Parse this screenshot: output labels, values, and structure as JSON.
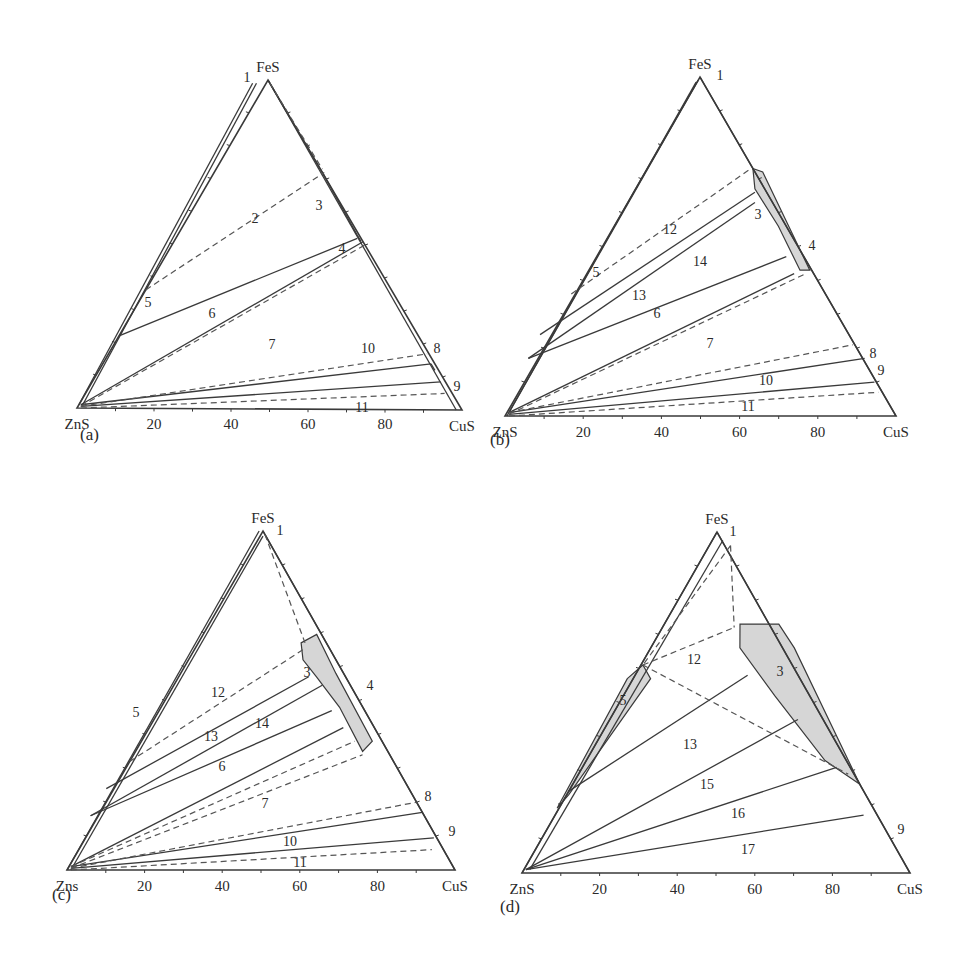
{
  "figure": {
    "line_color": "#3a3a3a",
    "dash_color": "#555555",
    "fill_color": "#d6d6d6"
  },
  "panels": [
    {
      "id": "a",
      "label": "(a)",
      "vertices": {
        "ZnS": [
          77,
          408
        ],
        "CuS": [
          462,
          410
        ],
        "FeS": [
          268,
          80
        ]
      },
      "vertex_labels": {
        "left": "ZnS",
        "right": "CuS",
        "top": "FeS"
      },
      "tick_labels": [
        "20",
        "40",
        "60",
        "80"
      ],
      "label_pos": [
        80,
        440
      ],
      "solid_lines": [
        [
          [
            0.005,
            0.01
          ],
          [
            0.46,
            0.99
          ]
        ],
        [
          [
            0.015,
            0.01
          ],
          [
            0.47,
            0.99
          ]
        ],
        [
          [
            0.5,
            1.0
          ],
          [
            0.985,
            0.0
          ]
        ],
        [
          [
            0.11,
            0.22
          ],
          [
            0.73,
            0.52
          ]
        ],
        [
          [
            0.01,
            0.01
          ],
          [
            0.745,
            0.51
          ]
        ],
        [
          [
            0.01,
            0.01
          ],
          [
            0.92,
            0.14
          ]
        ],
        [
          [
            0.01,
            0.005
          ],
          [
            0.945,
            0.085
          ]
        ],
        [
          [
            0.5,
            1.0
          ],
          [
            0.64,
            0.72
          ]
        ],
        [
          [
            0.64,
            0.72
          ],
          [
            0.73,
            0.53
          ]
        ],
        [
          [
            0.73,
            0.53
          ],
          [
            0.74,
            0.51
          ]
        ],
        [
          [
            0.92,
            0.14
          ],
          [
            0.93,
            0.12
          ]
        ]
      ],
      "dashed_lines": [
        [
          [
            0.18,
            0.36
          ],
          [
            0.645,
            0.72
          ]
        ],
        [
          [
            0.01,
            0.005
          ],
          [
            0.75,
            0.5
          ]
        ],
        [
          [
            0.01,
            0.005
          ],
          [
            0.91,
            0.17
          ]
        ],
        [
          [
            0.01,
            0.0
          ],
          [
            0.955,
            0.05
          ]
        ],
        [
          [
            0.505,
            0.99
          ],
          [
            0.64,
            0.73
          ]
        ]
      ],
      "filled_regions": [],
      "region_labels": [
        {
          "text": "1",
          "pos": [
            247,
            82
          ]
        },
        {
          "text": "2",
          "pos": [
            255,
            223
          ]
        },
        {
          "text": "3",
          "pos": [
            319,
            210
          ]
        },
        {
          "text": "4",
          "pos": [
            342,
            253
          ]
        },
        {
          "text": "5",
          "pos": [
            148,
            307
          ]
        },
        {
          "text": "6",
          "pos": [
            212,
            318
          ]
        },
        {
          "text": "7",
          "pos": [
            272,
            349
          ]
        },
        {
          "text": "10",
          "pos": [
            368,
            353
          ]
        },
        {
          "text": "8",
          "pos": [
            437,
            353
          ]
        },
        {
          "text": "9",
          "pos": [
            457,
            391
          ]
        },
        {
          "text": "11",
          "pos": [
            362,
            412
          ]
        }
      ]
    },
    {
      "id": "b",
      "label": "(b)",
      "vertices": {
        "ZnS": [
          505,
          416
        ],
        "CuS": [
          896,
          416
        ],
        "FeS": [
          700,
          77
        ]
      },
      "vertex_labels": {
        "left": "ZnS",
        "right": "CuS",
        "top": "FeS"
      },
      "tick_labels": [
        "20",
        "40",
        "60",
        "80"
      ],
      "label_pos": [
        490,
        445
      ],
      "solid_lines": [
        [
          [
            0.01,
            0.01
          ],
          [
            0.495,
            0.99
          ]
        ],
        [
          [
            0.005,
            0.0
          ],
          [
            0.49,
            0.985
          ]
        ],
        [
          [
            0.5,
            1.0
          ],
          [
            1.0,
            0.0
          ]
        ],
        [
          [
            0.09,
            0.24
          ],
          [
            0.64,
            0.66
          ]
        ],
        [
          [
            0.06,
            0.17
          ],
          [
            0.64,
            0.63
          ]
        ],
        [
          [
            0.06,
            0.17
          ],
          [
            0.72,
            0.47
          ]
        ],
        [
          [
            0.01,
            0.01
          ],
          [
            0.74,
            0.42
          ]
        ],
        [
          [
            0.01,
            0.01
          ],
          [
            0.92,
            0.17
          ]
        ],
        [
          [
            0.01,
            0.005
          ],
          [
            0.945,
            0.1
          ]
        ]
      ],
      "dashed_lines": [
        [
          [
            0.17,
            0.36
          ],
          [
            0.63,
            0.73
          ]
        ],
        [
          [
            0.01,
            0.005
          ],
          [
            0.77,
            0.42
          ]
        ],
        [
          [
            0.01,
            0.01
          ],
          [
            0.89,
            0.21
          ]
        ],
        [
          [
            0.01,
            0.0
          ],
          [
            0.955,
            0.07
          ]
        ]
      ],
      "filled_regions": [
        {
          "points": [
            [
              0.635,
              0.73
            ],
            [
              0.66,
              0.72
            ],
            [
              0.78,
              0.43
            ],
            [
              0.755,
              0.43
            ],
            [
              0.7,
              0.56
            ],
            [
              0.64,
              0.67
            ]
          ]
        }
      ],
      "region_labels": [
        {
          "text": "1",
          "pos": [
            720,
            80
          ]
        },
        {
          "text": "3",
          "pos": [
            758,
            219
          ]
        },
        {
          "text": "4",
          "pos": [
            812,
            250
          ]
        },
        {
          "text": "12",
          "pos": [
            670,
            234
          ]
        },
        {
          "text": "5",
          "pos": [
            596,
            277
          ]
        },
        {
          "text": "14",
          "pos": [
            700,
            266
          ]
        },
        {
          "text": "13",
          "pos": [
            639,
            300
          ]
        },
        {
          "text": "6",
          "pos": [
            657,
            318
          ]
        },
        {
          "text": "7",
          "pos": [
            710,
            348
          ]
        },
        {
          "text": "8",
          "pos": [
            873,
            358
          ]
        },
        {
          "text": "9",
          "pos": [
            881,
            375
          ]
        },
        {
          "text": "10",
          "pos": [
            766,
            385
          ]
        },
        {
          "text": "11",
          "pos": [
            748,
            411
          ]
        }
      ]
    },
    {
      "id": "c",
      "label": "(c)",
      "vertices": {
        "ZnS": [
          67,
          870
        ],
        "CuS": [
          455,
          870
        ],
        "FeS": [
          263,
          531
        ]
      },
      "vertex_labels": {
        "left": "Zns",
        "right": "CuS",
        "top": "FeS"
      },
      "tick_labels": [
        "20",
        "40",
        "60",
        "80"
      ],
      "label_pos": [
        52,
        900
      ],
      "solid_lines": [
        [
          [
            0.0,
            0.0
          ],
          [
            0.49,
            1.0
          ]
        ],
        [
          [
            0.01,
            0.0
          ],
          [
            0.5,
            0.985
          ]
        ],
        [
          [
            0.5,
            1.0
          ],
          [
            1.0,
            0.0
          ]
        ],
        [
          [
            0.1,
            0.24
          ],
          [
            0.62,
            0.57
          ]
        ],
        [
          [
            0.06,
            0.16
          ],
          [
            0.655,
            0.545
          ]
        ],
        [
          [
            0.06,
            0.16
          ],
          [
            0.68,
            0.47
          ]
        ],
        [
          [
            0.01,
            0.01
          ],
          [
            0.71,
            0.42
          ]
        ],
        [
          [
            0.01,
            0.01
          ],
          [
            0.915,
            0.17
          ]
        ],
        [
          [
            0.01,
            0.005
          ],
          [
            0.945,
            0.095
          ]
        ]
      ],
      "dashed_lines": [
        [
          [
            0.16,
            0.32
          ],
          [
            0.605,
            0.65
          ]
        ],
        [
          [
            0.01,
            0.01
          ],
          [
            0.74,
            0.38
          ]
        ],
        [
          [
            0.01,
            0.005
          ],
          [
            0.76,
            0.34
          ]
        ],
        [
          [
            0.01,
            0.005
          ],
          [
            0.9,
            0.2
          ]
        ],
        [
          [
            0.01,
            0.0
          ],
          [
            0.94,
            0.06
          ]
        ],
        [
          [
            0.505,
            0.99
          ],
          [
            0.61,
            0.67
          ]
        ]
      ],
      "filled_regions": [
        {
          "points": [
            [
              0.6,
              0.67
            ],
            [
              0.64,
              0.695
            ],
            [
              0.69,
              0.58
            ],
            [
              0.785,
              0.38
            ],
            [
              0.76,
              0.35
            ],
            [
              0.7,
              0.48
            ],
            [
              0.64,
              0.57
            ],
            [
              0.605,
              0.62
            ]
          ]
        }
      ],
      "region_labels": [
        {
          "text": "1",
          "pos": [
            280,
            535
          ]
        },
        {
          "text": "3",
          "pos": [
            307,
            677
          ]
        },
        {
          "text": "4",
          "pos": [
            370,
            690
          ]
        },
        {
          "text": "12",
          "pos": [
            218,
            697
          ]
        },
        {
          "text": "5",
          "pos": [
            136,
            717
          ]
        },
        {
          "text": "14",
          "pos": [
            262,
            728
          ]
        },
        {
          "text": "13",
          "pos": [
            211,
            741
          ]
        },
        {
          "text": "6",
          "pos": [
            222,
            771
          ]
        },
        {
          "text": "7",
          "pos": [
            265,
            808
          ]
        },
        {
          "text": "8",
          "pos": [
            428,
            801
          ]
        },
        {
          "text": "9",
          "pos": [
            452,
            836
          ]
        },
        {
          "text": "10",
          "pos": [
            290,
            846
          ]
        },
        {
          "text": "11",
          "pos": [
            300,
            867
          ]
        }
      ]
    },
    {
      "id": "d",
      "label": "(d)",
      "vertices": {
        "ZnS": [
          522,
          873
        ],
        "CuS": [
          910,
          873
        ],
        "FeS": [
          717,
          532
        ]
      },
      "vertex_labels": {
        "left": "ZnS",
        "right": "CuS",
        "top": "FeS"
      },
      "tick_labels": [
        "20",
        "40",
        "60",
        "80"
      ],
      "label_pos": [
        500,
        912
      ],
      "solid_lines": [
        [
          [
            0.0,
            0.0
          ],
          [
            0.5,
            1.0
          ]
        ],
        [
          [
            0.02,
            0.01
          ],
          [
            0.515,
            0.975
          ]
        ],
        [
          [
            0.5,
            1.0
          ],
          [
            1.0,
            0.0
          ]
        ],
        [
          [
            0.12,
            0.24
          ],
          [
            0.58,
            0.58
          ]
        ],
        [
          [
            0.01,
            0.01
          ],
          [
            0.71,
            0.45
          ]
        ],
        [
          [
            0.01,
            0.01
          ],
          [
            0.81,
            0.31
          ]
        ],
        [
          [
            0.01,
            0.01
          ],
          [
            0.88,
            0.17
          ]
        ]
      ],
      "dashed_lines": [
        [
          [
            0.535,
            0.96
          ],
          [
            0.31,
            0.61
          ]
        ],
        [
          [
            0.535,
            0.96
          ],
          [
            0.545,
            0.72
          ]
        ],
        [
          [
            0.31,
            0.61
          ],
          [
            0.545,
            0.72
          ]
        ],
        [
          [
            0.31,
            0.61
          ],
          [
            0.84,
            0.29
          ]
        ]
      ],
      "filled_regions": [
        {
          "points": [
            [
              0.56,
              0.73
            ],
            [
              0.66,
              0.73
            ],
            [
              0.7,
              0.66
            ],
            [
              0.87,
              0.26
            ],
            [
              0.78,
              0.33
            ],
            [
              0.65,
              0.52
            ],
            [
              0.56,
              0.66
            ]
          ]
        },
        {
          "points": [
            [
              0.27,
              0.57
            ],
            [
              0.31,
              0.61
            ],
            [
              0.33,
              0.57
            ],
            [
              0.12,
              0.23
            ],
            [
              0.09,
              0.19
            ]
          ]
        }
      ],
      "region_labels": [
        {
          "text": "1",
          "pos": [
            733,
            536
          ]
        },
        {
          "text": "12",
          "pos": [
            694,
            664
          ]
        },
        {
          "text": "3",
          "pos": [
            780,
            676
          ]
        },
        {
          "text": "5",
          "pos": [
            623,
            705
          ]
        },
        {
          "text": "13",
          "pos": [
            690,
            749
          ]
        },
        {
          "text": "15",
          "pos": [
            707,
            789
          ]
        },
        {
          "text": "16",
          "pos": [
            738,
            818
          ]
        },
        {
          "text": "17",
          "pos": [
            748,
            854
          ]
        },
        {
          "text": "9",
          "pos": [
            901,
            834
          ]
        }
      ]
    }
  ]
}
